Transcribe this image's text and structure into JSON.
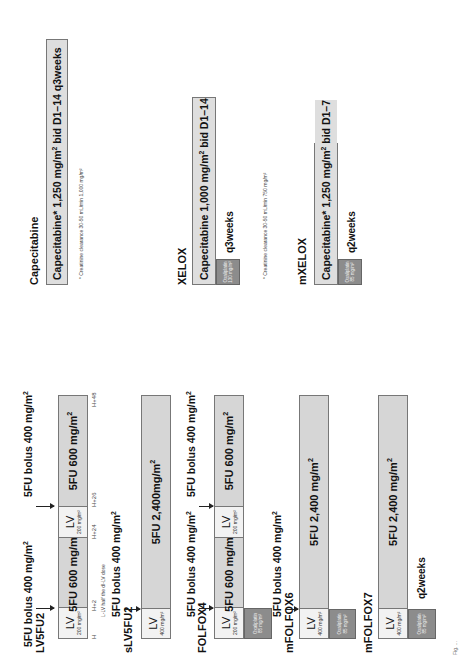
{
  "figure": {
    "orientation": "rotated 90 degrees counter-clockwise",
    "caption_fragment": "Fig. ..."
  },
  "regimens": {
    "lv5fu2": {
      "name": "LV5FU2",
      "bolus_1": "5FU bolus 400 mg/m",
      "bolus_2": "5FU bolus 400 mg/m",
      "segments": [
        {
          "type": "LV",
          "label": "LV",
          "dose": "200 mg/m²"
        },
        {
          "type": "5FU",
          "label": "5FU 600 mg/m"
        },
        {
          "type": "LV",
          "label": "LV",
          "dose": "200 mg/m²"
        },
        {
          "type": "5FU",
          "label": "5FU 600 mg/m"
        }
      ],
      "timepoints": [
        "H",
        "H+2",
        "H+24",
        "H+26",
        "H+48"
      ],
      "note": "L-LV half the dl-LV dose"
    },
    "slv5fu2": {
      "name": "sLV5FU2",
      "bolus": "5FU bolus 400 mg/m",
      "segments": [
        {
          "type": "LV",
          "label": "LV",
          "dose": "400 mg/m²"
        },
        {
          "type": "5FU",
          "label": "5FU 2,400mg/m"
        }
      ]
    },
    "folfox4": {
      "name": "FOLFOX4",
      "bolus_1": "5FU bolus 400 mg/m",
      "bolus_2": "5FU bolus 400 mg/m",
      "segments": [
        {
          "type": "LV",
          "label": "LV",
          "dose": "200 mg/m²"
        },
        {
          "type": "5FU",
          "label": "5FU 600 mg/m"
        },
        {
          "type": "LV",
          "label": "LV",
          "dose": "200 mg/m²"
        },
        {
          "type": "5FU",
          "label": "5FU 600 mg/m"
        }
      ],
      "oxaliplatin": {
        "label": "Oxaliplatin",
        "dose": "85 mg/m²"
      }
    },
    "mfolfox6": {
      "name": "mFOLFOX6",
      "bolus": "5FU bolus 400 mg/m",
      "segments": [
        {
          "type": "LV",
          "label": "LV",
          "dose": "400 mg/m²"
        },
        {
          "type": "5FU",
          "label": "5FU 2,400 mg/m"
        }
      ],
      "oxaliplatin": {
        "label": "Oxaliplatin",
        "dose": "85 mg/m²"
      }
    },
    "mfolfox7": {
      "name": "mFOLFOX7",
      "segments": [
        {
          "type": "LV",
          "label": "LV",
          "dose": "400 mg/m²"
        },
        {
          "type": "5FU",
          "label": "5FU 2,400 mg/m"
        }
      ],
      "oxaliplatin": {
        "label": "Oxaliplatin",
        "dose": "85 mg/m²"
      },
      "cycle": "q2weeks"
    },
    "capecitabine": {
      "name": "Capecitabine",
      "bar_prefix": "Capecitabine* 1,250 mg/m",
      "bar_suffix": " bid D1–14 q3weeks",
      "note": "* Creatinine clearance 30-50 mL/min 1,000 mg/m²"
    },
    "xelox": {
      "name": "XELOX",
      "bar_prefix": "Capecitabine 1,000 mg/m",
      "bar_suffix": " bid D1–14",
      "oxaliplatin": {
        "label": "Oxaliplatin",
        "dose": "130 mg/m²"
      },
      "cycle": "q3weeks",
      "note": "* Creatinine clearance 30-50 mL/min 750 mg/m²"
    },
    "mxelox": {
      "name": "mXELOX",
      "bar_prefix": "Capecitabine* 1,250 mg/m",
      "bar_suffix": " bid D1–7",
      "oxaliplatin": {
        "label": "Oxaliplatin",
        "dose": "85 mg/m²"
      },
      "cycle": "q2weeks"
    }
  },
  "superscript": "2",
  "colors": {
    "lv_fill": "#f2f2f2",
    "fu_fill": "#d6d6d6",
    "capecitabine_fill": "#dedede",
    "oxaliplatin_fill": "#8c8c8c",
    "border": "#777777"
  }
}
